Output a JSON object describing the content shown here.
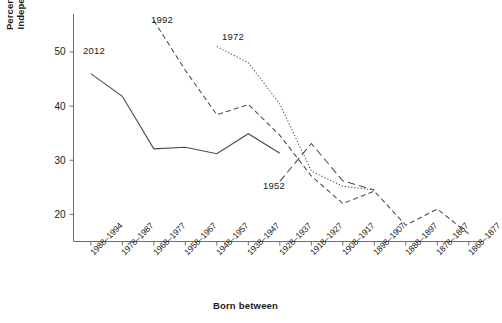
{
  "chart_data": {
    "type": "line",
    "title": "",
    "xlabel": "Born between",
    "ylabel": "Percentage of Independents",
    "ylabel_lines": [
      "Percentage of",
      "Independents"
    ],
    "categories": [
      "1988–1994",
      "1978–1987",
      "1968–1977",
      "1958–1967",
      "1948–1957",
      "1938–1947",
      "1928–1937",
      "1918–1927",
      "1908–1917",
      "1898–1907",
      "1888–1897",
      "1878–1887",
      "1868–1877"
    ],
    "yticks": [
      20,
      30,
      40,
      50
    ],
    "ylim": [
      15,
      57
    ],
    "grid": false,
    "legend_position": "inline-annotations",
    "series": [
      {
        "name": "2012",
        "style": "solid",
        "color": "#4a4a4a",
        "start_category": "1988–1994",
        "values": [
          46.0,
          41.8,
          32.1,
          32.4,
          31.2,
          34.9,
          31.3,
          null,
          null,
          null,
          null,
          null,
          null
        ]
      },
      {
        "name": "1992",
        "style": "dashed",
        "color": "#4a4a4a",
        "start_category": "1968–1977",
        "values": [
          null,
          null,
          55.8,
          46.6,
          38.4,
          40.3,
          34.6,
          27.1,
          22.0,
          24.3,
          18.0,
          21.0,
          16.4
        ]
      },
      {
        "name": "1972",
        "style": "dotted",
        "color": "#4a4a4a",
        "start_category": "1948–1957",
        "values": [
          null,
          null,
          null,
          null,
          51.0,
          48.0,
          40.4,
          28.0,
          25.2,
          24.5,
          null,
          null,
          null
        ]
      },
      {
        "name": "1952",
        "style": "long-dashed",
        "color": "#4a4a4a",
        "start_category": "1928–1937",
        "values": [
          null,
          null,
          null,
          null,
          null,
          null,
          26.1,
          33.1,
          26.2,
          24.5,
          null,
          null,
          null
        ]
      }
    ],
    "annotations": [
      {
        "text": "2012",
        "x_px": 83,
        "y_px": 45
      },
      {
        "text": "1992",
        "x_px": 151,
        "y_px": 14
      },
      {
        "text": "1972",
        "x_px": 222,
        "y_px": 31
      },
      {
        "text": "1952",
        "x_px": 263,
        "y_px": 180
      }
    ]
  }
}
